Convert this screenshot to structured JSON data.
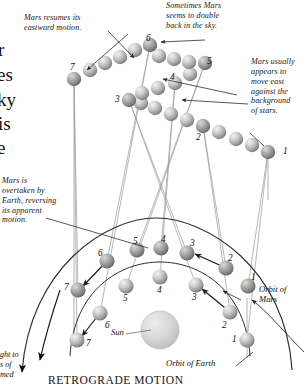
{
  "figure": {
    "caption": "RETROGRADE MOTION",
    "sun_label": "Sun",
    "orbit_mars_label": "Orbit of Mars",
    "orbit_earth_label": "Orbit of Earth"
  },
  "annotations": {
    "mars_resumes": "Mars resumes its\neastward motion.",
    "double_back": "Sometimes Mars\nseems to double\nback in the sky.",
    "moves_east": "Mars usually\nappears to\nmove east\nagainst the\nbackground\nof stars.",
    "overtaken": "Mars is\novertaken by\nEarth, reversing\nits apparent\nmotion."
  },
  "edge_fragments": {
    "body_text": [
      "r",
      "es",
      "ky",
      "is",
      "e"
    ],
    "bottom_text": [
      "ght to",
      "s of",
      "med"
    ]
  },
  "sky_path": {
    "label": "apparent path of Mars in the sky",
    "markers": [
      {
        "n": "1",
        "x": 268,
        "y": 152
      },
      {
        "n": "2",
        "x": 203,
        "y": 126
      },
      {
        "n": "3",
        "x": 129,
        "y": 100
      },
      {
        "n": "4",
        "x": 175,
        "y": 83
      },
      {
        "n": "5",
        "x": 205,
        "y": 63
      },
      {
        "n": "6",
        "x": 150,
        "y": 45
      },
      {
        "n": "7",
        "x": 74,
        "y": 79
      }
    ]
  },
  "mars_orbit": {
    "label": "Mars positions on its orbit",
    "markers": [
      {
        "n": "1",
        "x": 248,
        "y": 286
      },
      {
        "n": "2",
        "x": 226,
        "y": 268
      },
      {
        "n": "3",
        "x": 187,
        "y": 253
      },
      {
        "n": "4",
        "x": 161,
        "y": 248
      },
      {
        "n": "5",
        "x": 137,
        "y": 250
      },
      {
        "n": "6",
        "x": 107,
        "y": 261
      },
      {
        "n": "7",
        "x": 78,
        "y": 290
      }
    ]
  },
  "earth_orbit": {
    "label": "Earth positions on its orbit",
    "markers": [
      {
        "n": "1",
        "x": 247,
        "y": 340
      },
      {
        "n": "2",
        "x": 230,
        "y": 312
      },
      {
        "n": "3",
        "x": 196,
        "y": 285
      },
      {
        "n": "4",
        "x": 160,
        "y": 277
      },
      {
        "n": "5",
        "x": 126,
        "y": 286
      },
      {
        "n": "6",
        "x": 100,
        "y": 313
      },
      {
        "n": "7",
        "x": 77,
        "y": 340
      }
    ]
  },
  "colors": {
    "sphere_base": "#8d8d8d",
    "sphere_light": "#e8e8e8",
    "sun_fill": "#d3d3d3",
    "line": "#4a4a4a",
    "sightline": "#8a8a8a",
    "text": "#151515"
  }
}
